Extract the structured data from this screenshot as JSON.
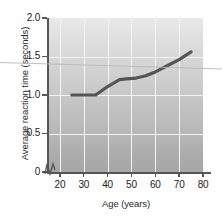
{
  "figure": {
    "background_color": "#fefefe",
    "plot_fill_top": "#e9e9e9",
    "plot_fill_bottom": "#a6a6a6",
    "gridline_color": "#f4f4f4",
    "axis_color": "#555555",
    "line_color": "#555555"
  },
  "axis_break_symbol": "zigzag-break",
  "chart_data": {
    "type": "line",
    "title": "",
    "subtitle": "",
    "xlabel": "Age (years)",
    "ylabel": "Average reaction time (seconds)",
    "xlim": [
      15,
      80
    ],
    "ylim": [
      0,
      2.0
    ],
    "xticks": [
      20,
      30,
      40,
      50,
      60,
      70,
      80
    ],
    "xticklabels": [
      "20",
      "30",
      "40",
      "50",
      "60",
      "70",
      "80"
    ],
    "yticks": [
      0,
      0.5,
      1.0,
      1.5,
      2.0
    ],
    "yticklabels": [
      "0",
      "0.5",
      "1.0",
      "1.5",
      "2.0"
    ],
    "grid": true,
    "grid_axis": "both",
    "legend": null,
    "legend_position": "none",
    "y_axis_break": true,
    "series": [
      {
        "name": "Average reaction time",
        "color": "#555555",
        "linewidth": 3,
        "x": [
          25,
          30,
          35,
          40,
          45,
          48,
          52,
          56,
          60,
          65,
          70,
          75
        ],
        "y": [
          1.0,
          1.0,
          1.0,
          1.11,
          1.2,
          1.21,
          1.22,
          1.25,
          1.3,
          1.38,
          1.46,
          1.56
        ]
      }
    ],
    "annotations": []
  }
}
